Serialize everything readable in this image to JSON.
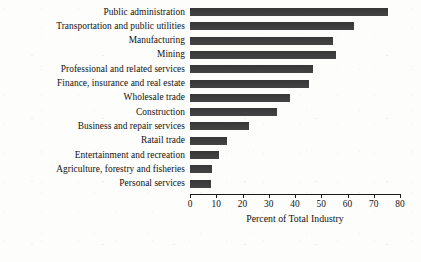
{
  "chart_data": {
    "type": "bar",
    "orientation": "horizontal",
    "title": "",
    "xlabel": "Percent of Total Industry",
    "ylabel": "",
    "xlim": [
      0,
      80
    ],
    "xticks": [
      0,
      10,
      20,
      30,
      40,
      50,
      60,
      70,
      80
    ],
    "grid": false,
    "legend": false,
    "bar_color": "#3a3a3a",
    "categories": [
      "Public administration",
      "Transportation and public utilities",
      "Manufacturing",
      "Mining",
      "Professional and related services",
      "Finance, insurance and real estate",
      "Wholesale trade",
      "Construction",
      "Business and repair services",
      "Ratail trade",
      "Entertainment and recreation",
      "Agriculture, forestry and fisheries",
      "Personal services"
    ],
    "values": [
      75.5,
      62.5,
      54.5,
      55.5,
      47,
      45.5,
      38,
      33,
      22.5,
      14,
      11,
      8.5,
      8
    ]
  }
}
